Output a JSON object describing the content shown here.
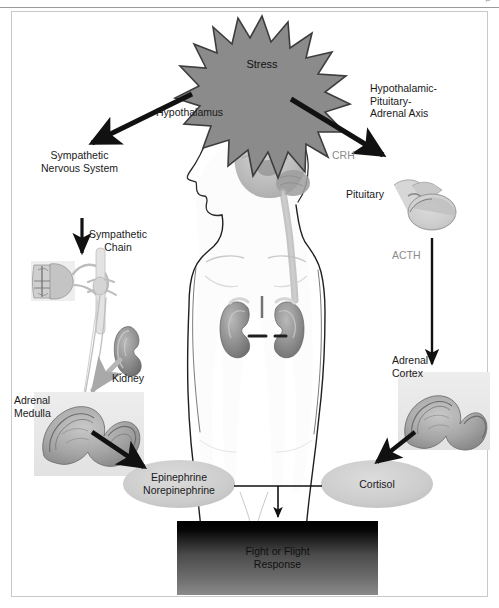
{
  "page": {
    "header_mark": "⌐",
    "width": 499,
    "height": 608
  },
  "diagram": {
    "title_node": "Stress",
    "nodes": {
      "stress": "Stress",
      "hypothalamus": "Hypothalamus",
      "sympathetic_nervous_system": "Sympathetic\nNervous System",
      "hpa_axis": "Hypothalamic-\nPituitary-\nAdrenal Axis",
      "crh": "CRH",
      "acth": "ACTH",
      "pituitary": "Pituitary",
      "sympathetic_chain": "Sympathetic\nChain",
      "kidney": "Kidney",
      "adrenal_medulla": "Adrenal\nMedulla",
      "adrenal_cortex": "Adrenal\nCortex",
      "catecholamines": "Epinephrine\nNorepinephrine",
      "cortisol": "Cortisol",
      "outcome": "Fight or Flight\nResponse"
    },
    "colors": {
      "starburst_fill": "#8b8b8b",
      "starburst_stroke": "#3d3d3d",
      "ellipse_fill": "#cfcfcf",
      "outcome_gradient_top": "#000000",
      "outcome_gradient_bottom": "#7d7d7d",
      "arrow_dark": "#111111",
      "gray_label": "#8b8b8b",
      "frame_border": "#c9c9c9",
      "organ_tint": "#9a9a9a"
    },
    "arrows": [
      {
        "name": "stress-to-sympathetic",
        "label": ""
      },
      {
        "name": "stress-to-hpa",
        "label": "CRH"
      },
      {
        "name": "sympathetic-to-chain",
        "label": ""
      },
      {
        "name": "pituitary-to-adrenal-cortex",
        "label": "ACTH"
      },
      {
        "name": "chain-to-adrenal-medulla",
        "label": ""
      },
      {
        "name": "adrenal-medulla-to-catecholamines",
        "label": ""
      },
      {
        "name": "adrenal-cortex-to-cortisol",
        "label": ""
      },
      {
        "name": "hormones-to-outcome",
        "label": ""
      }
    ]
  }
}
